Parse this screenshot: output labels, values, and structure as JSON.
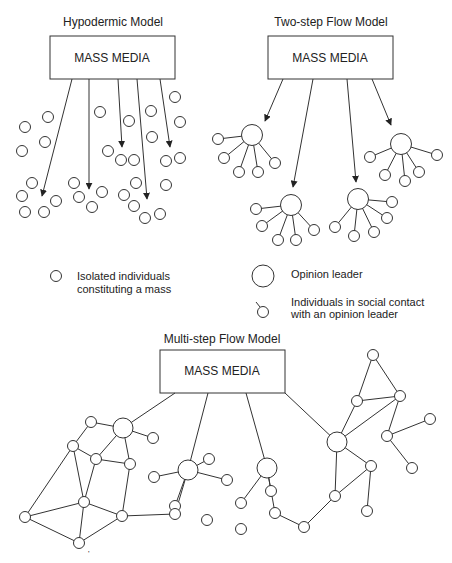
{
  "colors": {
    "stroke": "#333333",
    "text": "#222222",
    "background": "#ffffff"
  },
  "hypodermic": {
    "title": "Hypodermic Model",
    "box_label": "MASS MEDIA",
    "box": [
      50,
      36,
      125,
      43
    ],
    "arrows": [
      [
        72,
        79,
        42,
        196
      ],
      [
        89,
        79,
        89,
        189
      ],
      [
        118,
        79,
        122,
        147
      ],
      [
        137,
        79,
        147,
        199
      ],
      [
        160,
        79,
        170,
        147
      ]
    ],
    "circles": [
      [
        48,
        117
      ],
      [
        25,
        127
      ],
      [
        45,
        142
      ],
      [
        22,
        151
      ],
      [
        100,
        112
      ],
      [
        129,
        121
      ],
      [
        151,
        111
      ],
      [
        175,
        97
      ],
      [
        180,
        122
      ],
      [
        152,
        137
      ],
      [
        108,
        151
      ],
      [
        121,
        160
      ],
      [
        134,
        160
      ],
      [
        166,
        161
      ],
      [
        180,
        158
      ],
      [
        32,
        183
      ],
      [
        22,
        196
      ],
      [
        56,
        201
      ],
      [
        25,
        212
      ],
      [
        44,
        212
      ],
      [
        74,
        183
      ],
      [
        79,
        197
      ],
      [
        102,
        192
      ],
      [
        92,
        207
      ],
      [
        136,
        183
      ],
      [
        124,
        195
      ],
      [
        166,
        185
      ],
      [
        134,
        206
      ],
      [
        145,
        218
      ],
      [
        160,
        214
      ]
    ]
  },
  "two_step": {
    "title": "Two-step Flow Model",
    "box_label": "MASS MEDIA",
    "box": [
      268,
      36,
      125,
      43
    ],
    "arrows": [
      [
        283,
        79,
        265,
        121
      ],
      [
        313,
        79,
        293,
        187
      ],
      [
        347,
        79,
        356,
        182
      ],
      [
        372,
        79,
        391,
        125
      ]
    ],
    "clusters": [
      {
        "leader": [
          252,
          135
        ],
        "followers": [
          [
            218,
            139
          ],
          [
            224,
            158
          ],
          [
            239,
            172
          ],
          [
            258,
            172
          ],
          [
            275,
            163
          ]
        ]
      },
      {
        "leader": [
          291,
          205
        ],
        "followers": [
          [
            256,
            209
          ],
          [
            262,
            226
          ],
          [
            278,
            240
          ],
          [
            296,
            240
          ],
          [
            314,
            230
          ]
        ]
      },
      {
        "leader": [
          358,
          199
        ],
        "followers": [
          [
            392,
            202
          ],
          [
            387,
            218
          ],
          [
            374,
            232
          ],
          [
            354,
            236
          ],
          [
            335,
            227
          ]
        ]
      },
      {
        "leader": [
          401,
          144
        ],
        "followers": [
          [
            437,
            155
          ],
          [
            419,
            172
          ],
          [
            405,
            181
          ],
          [
            385,
            175
          ],
          [
            370,
            157
          ]
        ]
      }
    ]
  },
  "legend": {
    "isolated_line1": "Isolated individuals",
    "isolated_line2": "constituting a mass",
    "leader": "Opinion leader",
    "contact_line1": "Individuals in social contact",
    "contact_line2": "with an opinion leader"
  },
  "multi_step": {
    "title": "Multi-step Flow Model",
    "box_label": "MASS MEDIA",
    "box": [
      160,
      350,
      125,
      43
    ],
    "nodes": {
      "A": [
        123,
        428,
        8
      ],
      "B": [
        91,
        422,
        5
      ],
      "C": [
        153,
        438,
        5
      ],
      "D": [
        73,
        446,
        5
      ],
      "E": [
        96,
        459,
        5
      ],
      "F": [
        130,
        464,
        5
      ],
      "G": [
        84,
        502,
        5
      ],
      "H": [
        25,
        517,
        5
      ],
      "I": [
        122,
        516,
        5
      ],
      "J": [
        79,
        543,
        5
      ],
      "K": [
        188,
        470,
        8
      ],
      "L": [
        154,
        477,
        5
      ],
      "M": [
        209,
        459,
        5
      ],
      "N": [
        227,
        480,
        5
      ],
      "O": [
        175,
        506,
        5
      ],
      "P": [
        207,
        520,
        5
      ],
      "Q": [
        241,
        529,
        5
      ],
      "R": [
        175,
        514,
        5
      ],
      "S": [
        267,
        468,
        8
      ],
      "T": [
        241,
        503,
        5
      ],
      "U": [
        271,
        491,
        5
      ],
      "V": [
        337,
        442,
        8
      ],
      "W": [
        373,
        355,
        5
      ],
      "X": [
        357,
        401,
        5
      ],
      "Y": [
        400,
        396,
        5
      ],
      "Z": [
        387,
        436,
        5
      ],
      "AA": [
        430,
        419,
        5
      ],
      "AB": [
        412,
        468,
        5
      ],
      "AC": [
        371,
        466,
        5
      ],
      "AD": [
        335,
        496,
        5
      ],
      "AE": [
        367,
        511,
        5
      ],
      "AF": [
        304,
        527,
        5
      ],
      "AG": [
        275,
        513,
        5
      ]
    },
    "box_links": [
      [
        175,
        393,
        123,
        428
      ],
      [
        208,
        393,
        188,
        470
      ],
      [
        246,
        393,
        267,
        468
      ],
      [
        285,
        393,
        337,
        442
      ]
    ],
    "edges": [
      [
        "A",
        "B"
      ],
      [
        "A",
        "C"
      ],
      [
        "A",
        "F"
      ],
      [
        "A",
        "E"
      ],
      [
        "B",
        "D"
      ],
      [
        "D",
        "E"
      ],
      [
        "E",
        "F"
      ],
      [
        "D",
        "H"
      ],
      [
        "D",
        "G"
      ],
      [
        "E",
        "G"
      ],
      [
        "F",
        "I"
      ],
      [
        "G",
        "H"
      ],
      [
        "G",
        "I"
      ],
      [
        "G",
        "J"
      ],
      [
        "H",
        "J"
      ],
      [
        "I",
        "J"
      ],
      [
        "I",
        "R"
      ],
      [
        "R",
        "K"
      ],
      [
        "K",
        "L"
      ],
      [
        "K",
        "M"
      ],
      [
        "K",
        "N"
      ],
      [
        "K",
        "O"
      ],
      [
        "S",
        "T"
      ],
      [
        "S",
        "U"
      ],
      [
        "S",
        "AG"
      ],
      [
        "V",
        "X"
      ],
      [
        "V",
        "Y"
      ],
      [
        "V",
        "AC"
      ],
      [
        "V",
        "AD"
      ],
      [
        "X",
        "W"
      ],
      [
        "W",
        "Y"
      ],
      [
        "X",
        "Y"
      ],
      [
        "Y",
        "Z"
      ],
      [
        "Z",
        "AA"
      ],
      [
        "Z",
        "AB"
      ],
      [
        "AC",
        "AE"
      ],
      [
        "AC",
        "AD"
      ],
      [
        "AD",
        "AF"
      ],
      [
        "AF",
        "AG"
      ]
    ]
  },
  "footnote": "'"
}
